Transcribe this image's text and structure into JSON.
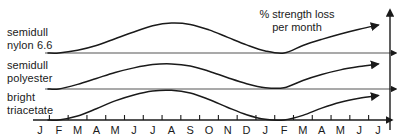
{
  "chart_data": {
    "type": "line",
    "title_line1": "% strength loss",
    "title_line2": "per month",
    "xlabel": "",
    "ylabel": "% strength loss per month",
    "grid": false,
    "legend_position": "left-inline",
    "x": [
      "J",
      "F",
      "M",
      "A",
      "M",
      "J",
      "J",
      "A",
      "S",
      "O",
      "N",
      "D",
      "J",
      "F",
      "M",
      "A",
      "M",
      "J",
      "J"
    ],
    "categories": [
      "J",
      "F",
      "M",
      "A",
      "M",
      "J",
      "J",
      "A",
      "S",
      "O",
      "N",
      "D",
      "J",
      "F",
      "M",
      "A",
      "M",
      "J",
      "J"
    ],
    "series": [
      {
        "name": "semidull nylon 6.6",
        "label_line1": "semidull",
        "label_line2": "nylon 6.6",
        "baseline_y": 0,
        "values": [
          0,
          0,
          0.08,
          0.22,
          0.42,
          0.62,
          0.8,
          0.88,
          0.84,
          0.68,
          0.46,
          0.24,
          0.06,
          0.0,
          0.22,
          0.4,
          0.56,
          0.7,
          0.82
        ]
      },
      {
        "name": "semidull polyester",
        "label_line1": "semidull",
        "label_line2": "polyester",
        "baseline_y": 0,
        "values": [
          0,
          0,
          0.14,
          0.32,
          0.5,
          0.64,
          0.74,
          0.76,
          0.7,
          0.54,
          0.34,
          0.16,
          0.04,
          0.04,
          0.26,
          0.44,
          0.58,
          0.68,
          0.76
        ]
      },
      {
        "name": "bright triacetate",
        "label_line1": "bright",
        "label_line2": "triacetate",
        "baseline_y": 0,
        "values": [
          0,
          0,
          0.12,
          0.34,
          0.58,
          0.76,
          0.88,
          0.9,
          0.82,
          0.62,
          0.38,
          0.16,
          0.02,
          0.0,
          0.14,
          0.36,
          0.54,
          0.66,
          0.74
        ]
      }
    ],
    "colors": {
      "line": "#1a1a1a",
      "axis": "#4d4d4d",
      "background": "#ffffff"
    },
    "axes": {
      "y_axis_arrow": true,
      "x_axis_arrow": true,
      "baseline_arrows": true,
      "tick_count": 19
    }
  }
}
